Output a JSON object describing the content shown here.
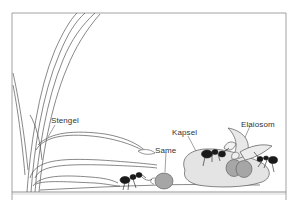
{
  "diagram": {
    "labels": {
      "stem": "Stengel",
      "seed": "Same",
      "capsule": "Kapsel",
      "elaiosome": "Elaiosom"
    },
    "colors": {
      "outline": "#555555",
      "frame": "#8a8a8a",
      "capsule_fill": "#e4e4e4",
      "seed_fill": "#a6a6a6",
      "ant": "#1a1a1a",
      "background": "#ffffff"
    },
    "elements": [
      "frame",
      "ground-line",
      "plant-stem",
      "leaf-blades",
      "ant-carrying-seed",
      "seed",
      "capsule",
      "ant-on-capsule-left",
      "ant-on-capsule-right",
      "seeds-with-elaiosomes"
    ]
  }
}
